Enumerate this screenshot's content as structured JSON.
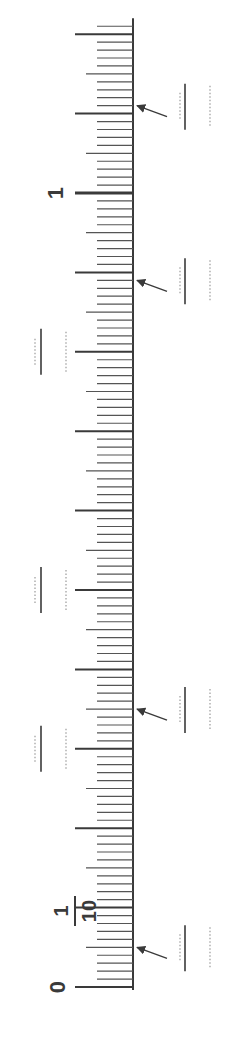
{
  "number_line": {
    "orientation": "vertical-rotated",
    "min": 0,
    "max": 1.21,
    "major_step": 0.1,
    "minor_step": 0.01,
    "labels": [
      {
        "value": 0,
        "text": "0"
      },
      {
        "value": 0.1,
        "text_num": "1",
        "text_den": "10"
      },
      {
        "value": 1,
        "text": "1"
      }
    ],
    "arrows": [
      {
        "value": 0.05,
        "label": "arrow-at-0.05"
      },
      {
        "value": 0.35,
        "label": "arrow-at-0.35"
      },
      {
        "value": 0.89,
        "label": "arrow-at-0.89"
      },
      {
        "value": 1.11,
        "label": "arrow-at-1.11"
      }
    ],
    "answer_blanks_right": [
      0.05,
      0.35,
      0.89,
      1.11
    ],
    "answer_blanks_left": [
      0.3,
      0.5,
      0.8
    ]
  },
  "colors": {
    "line": "#3a3a3a",
    "tick": "#555555",
    "dotted": "#9a9a9a"
  }
}
